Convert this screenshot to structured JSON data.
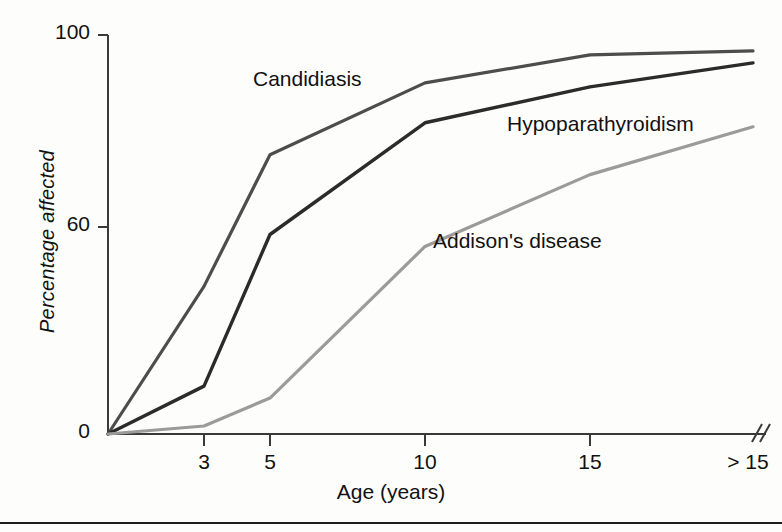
{
  "chart_data": {
    "type": "line",
    "title": "",
    "subtitle": "",
    "xlabel": "Age (years)",
    "ylabel": "Percentage affected",
    "grid": false,
    "legend_position": "inline-labels",
    "x_tick_labels": [
      "3",
      "5",
      "10",
      "15",
      "> 15"
    ],
    "x_tick_values": [
      3,
      5,
      10,
      15,
      16
    ],
    "x_axis_break": true,
    "x_axis_break_symbol": "//",
    "y_tick_labels": [
      "0",
      "60",
      "100"
    ],
    "y_tick_values": [
      0,
      60,
      100
    ],
    "ylim": [
      0,
      100
    ],
    "origin_label": "0",
    "series": [
      {
        "name": "Candidiasis",
        "color": "#4d4d4d",
        "x": [
          0,
          3,
          5,
          10,
          15,
          16
        ],
        "values": [
          0,
          37,
          70,
          88,
          95,
          96
        ]
      },
      {
        "name": "Hypoparathyroidism",
        "color": "#2b2b2b",
        "x": [
          0,
          3,
          5,
          10,
          15,
          16
        ],
        "values": [
          0,
          12,
          50,
          78,
          87,
          93
        ]
      },
      {
        "name": "Addison's disease",
        "color": "#9b9b9b",
        "x": [
          0,
          3,
          5,
          10,
          15,
          16
        ],
        "values": [
          0,
          2,
          9,
          47,
          65,
          77
        ]
      }
    ],
    "annotations": [
      {
        "text": "Candidiasis",
        "x_px": 253,
        "y_px": 67
      },
      {
        "text": "Hypoparathyroidism",
        "x_px": 507,
        "y_px": 112
      },
      {
        "text": "Addison's disease",
        "x_px": 433,
        "y_px": 229
      }
    ]
  },
  "axis": {
    "y_title": "Percentage affected",
    "x_title": "Age (years)",
    "y_ticks": [
      {
        "label": "100",
        "y_px": 35
      },
      {
        "label": "60",
        "y_px": 227
      },
      {
        "label": "0",
        "y_px": 434
      }
    ],
    "x_ticks": [
      {
        "label": "3",
        "x_px": 204
      },
      {
        "label": "5",
        "x_px": 270
      },
      {
        "label": "10",
        "x_px": 425
      },
      {
        "label": "15",
        "x_px": 590
      },
      {
        "label": "> 15",
        "x_px": 753
      }
    ]
  },
  "colors": {
    "candidiasis": "#4d4d4d",
    "hypoparathyroidism": "#2b2b2b",
    "addisons": "#9b9b9b",
    "axis": "#3a3a3a",
    "rule": "#1d1d1d"
  }
}
